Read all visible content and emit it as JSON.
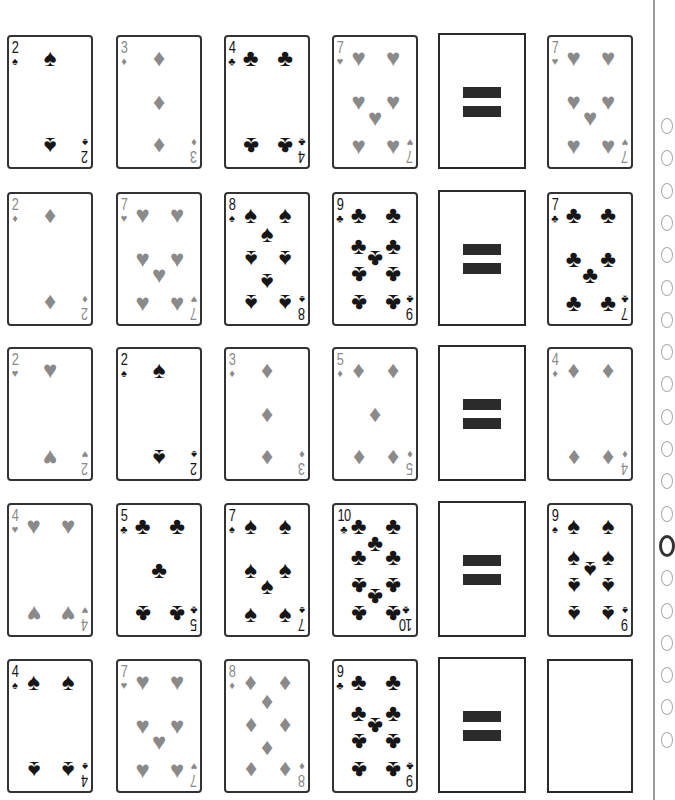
{
  "puzzle": {
    "equals_symbol": "=",
    "rows": [
      {
        "cards": [
          {
            "rank": "2",
            "suit": "spades",
            "glyph": "♠",
            "color": "black"
          },
          {
            "rank": "3",
            "suit": "diamonds",
            "glyph": "♦",
            "color": "red"
          },
          {
            "rank": "4",
            "suit": "clubs",
            "glyph": "♣",
            "color": "black"
          },
          {
            "rank": "7",
            "suit": "hearts",
            "glyph": "♥",
            "color": "red"
          }
        ],
        "result": {
          "rank": "7",
          "suit": "hearts",
          "glyph": "♥",
          "color": "red"
        }
      },
      {
        "cards": [
          {
            "rank": "2",
            "suit": "diamonds",
            "glyph": "♦",
            "color": "red"
          },
          {
            "rank": "7",
            "suit": "hearts",
            "glyph": "♥",
            "color": "red"
          },
          {
            "rank": "8",
            "suit": "spades",
            "glyph": "♠",
            "color": "black"
          },
          {
            "rank": "9",
            "suit": "clubs",
            "glyph": "♣",
            "color": "black"
          }
        ],
        "result": {
          "rank": "7",
          "suit": "clubs",
          "glyph": "♣",
          "color": "black"
        }
      },
      {
        "cards": [
          {
            "rank": "2",
            "suit": "hearts",
            "glyph": "♥",
            "color": "red"
          },
          {
            "rank": "2",
            "suit": "spades",
            "glyph": "♠",
            "color": "black"
          },
          {
            "rank": "3",
            "suit": "diamonds",
            "glyph": "♦",
            "color": "red"
          },
          {
            "rank": "5",
            "suit": "diamonds",
            "glyph": "♦",
            "color": "red"
          }
        ],
        "result": {
          "rank": "4",
          "suit": "diamonds",
          "glyph": "♦",
          "color": "red"
        }
      },
      {
        "cards": [
          {
            "rank": "4",
            "suit": "hearts",
            "glyph": "♥",
            "color": "red"
          },
          {
            "rank": "5",
            "suit": "clubs",
            "glyph": "♣",
            "color": "black"
          },
          {
            "rank": "7",
            "suit": "spades",
            "glyph": "♠",
            "color": "black"
          },
          {
            "rank": "10",
            "suit": "clubs",
            "glyph": "♣",
            "color": "black"
          }
        ],
        "result": {
          "rank": "9",
          "suit": "spades",
          "glyph": "♠",
          "color": "black"
        }
      },
      {
        "cards": [
          {
            "rank": "4",
            "suit": "spades",
            "glyph": "♠",
            "color": "black"
          },
          {
            "rank": "7",
            "suit": "hearts",
            "glyph": "♥",
            "color": "red"
          },
          {
            "rank": "8",
            "suit": "diamonds",
            "glyph": "♦",
            "color": "red"
          },
          {
            "rank": "9",
            "suit": "clubs",
            "glyph": "♣",
            "color": "black"
          }
        ],
        "result": null
      }
    ]
  },
  "answer_sheet": {
    "bubble_count": 20,
    "filled_index": 13
  },
  "colors": {
    "black_suit": "#161616",
    "red_suit_printed": "#8a8a8a",
    "card_border": "#333333",
    "equals_bar": "#2b2b2b",
    "divider": "#9a9a9a"
  }
}
